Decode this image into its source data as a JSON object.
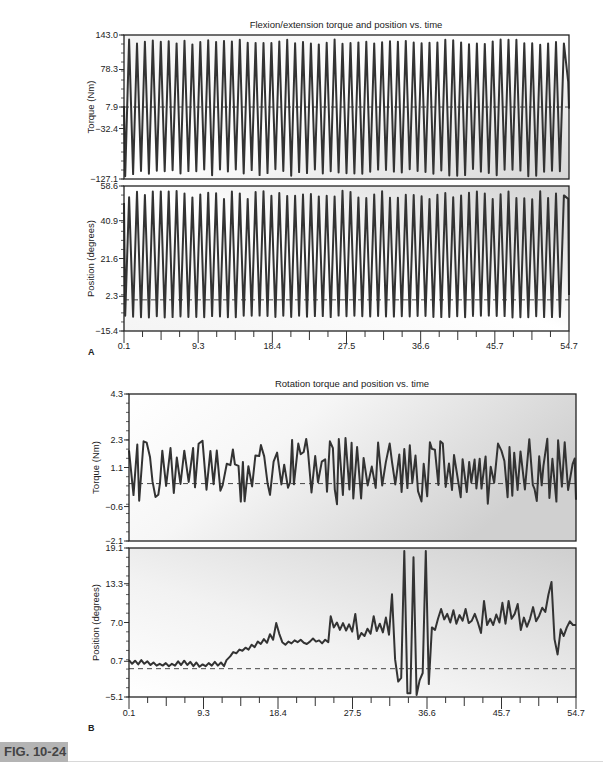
{
  "figure_label": "FIG. 10-24",
  "chart_data": [
    {
      "id": "A",
      "panel_letter": "A",
      "type": "line",
      "title": "Flexion/extension torque and position vs. time",
      "xlabel": "",
      "x_ticks": [
        "0.1",
        "9.3",
        "18.4",
        "27.5",
        "36.6",
        "45.7",
        "54.7"
      ],
      "xlim": [
        0.1,
        54.7
      ],
      "subplots": [
        {
          "name": "torque",
          "ylabel": "Torque (Nm)",
          "y_ticks": [
            "143.0",
            "78.3",
            "7.9",
            "-32.4",
            "-127.1"
          ],
          "y_tick_values": [
            143.0,
            78.3,
            7.9,
            -32.4,
            -127.1
          ],
          "ylim": [
            -127.1,
            143.0
          ],
          "reference_line": 7.9,
          "signal": {
            "kind": "oscillation",
            "cycles": 56,
            "peak": 130,
            "trough": -115,
            "start": 10,
            "end": 5,
            "end_peak": 55
          }
        },
        {
          "name": "position",
          "ylabel": "Position (degrees)",
          "y_ticks": [
            "58.6",
            "40.9",
            "21.6",
            "2.3",
            "-15.4"
          ],
          "y_tick_values": [
            58.6,
            40.9,
            21.6,
            2.3,
            -15.4
          ],
          "ylim": [
            -15.4,
            58.6
          ],
          "reference_line": 0.5,
          "signal": {
            "kind": "oscillation",
            "cycles": 56,
            "peak": 54,
            "trough": -8,
            "start": 50,
            "end": 3,
            "end_peak": 52
          }
        }
      ]
    },
    {
      "id": "B",
      "panel_letter": "B",
      "type": "line",
      "title": "Rotation torque and position vs. time",
      "xlabel": "",
      "x_ticks": [
        "0.1",
        "9.3",
        "18.4",
        "27.5",
        "36.6",
        "45.7",
        "54.7"
      ],
      "xlim": [
        0.1,
        54.7
      ],
      "subplots": [
        {
          "name": "torque",
          "ylabel": "Torque (Nm)",
          "y_ticks": [
            "4.3",
            "2.3",
            "1.1",
            "-0.6",
            "-2.1"
          ],
          "y_tick_values": [
            4.3,
            2.3,
            1.1,
            -0.6,
            -2.1
          ],
          "ylim": [
            -2.1,
            4.3
          ],
          "reference_line": 0.4,
          "signal": {
            "kind": "noisy",
            "high": 2.4,
            "low": -0.5
          }
        },
        {
          "name": "position",
          "ylabel": "Position (degrees)",
          "y_ticks": [
            "19.1",
            "13.3",
            "7.0",
            "0.7",
            "-5.1"
          ],
          "y_tick_values": [
            19.1,
            13.3,
            7.0,
            0.7,
            -5.1
          ],
          "ylim": [
            -5.1,
            19.1
          ],
          "reference_line": -0.5,
          "points": [
            [
              0.1,
              0.9
            ],
            [
              0.6,
              0.3
            ],
            [
              1.1,
              0.8
            ],
            [
              1.6,
              0.2
            ],
            [
              2.1,
              0.9
            ],
            [
              2.6,
              0.3
            ],
            [
              3.1,
              0.7
            ],
            [
              3.6,
              0.1
            ],
            [
              4.1,
              0.5
            ],
            [
              4.6,
              0.0
            ],
            [
              5.1,
              0.3
            ],
            [
              5.6,
              0.0
            ],
            [
              6.1,
              0.4
            ],
            [
              6.6,
              -0.1
            ],
            [
              7.1,
              0.3
            ],
            [
              7.6,
              0.0
            ],
            [
              8.1,
              0.7
            ],
            [
              8.6,
              0.1
            ],
            [
              9.1,
              0.8
            ],
            [
              9.6,
              0.1
            ],
            [
              10.1,
              0.6
            ],
            [
              10.6,
              -0.1
            ],
            [
              11.1,
              0.5
            ],
            [
              11.6,
              -0.2
            ],
            [
              12.1,
              0.2
            ],
            [
              12.6,
              -0.1
            ],
            [
              13.1,
              0.4
            ],
            [
              13.6,
              0.0
            ],
            [
              14.1,
              0.6
            ],
            [
              14.6,
              0.0
            ],
            [
              15.1,
              0.5
            ],
            [
              15.6,
              -0.1
            ],
            [
              16.0,
              0.9
            ],
            [
              16.6,
              1.5
            ],
            [
              17.1,
              2.2
            ],
            [
              17.6,
              2.0
            ],
            [
              18.1,
              2.6
            ],
            [
              18.6,
              2.4
            ],
            [
              19.1,
              2.9
            ],
            [
              19.6,
              2.6
            ],
            [
              20.1,
              3.4
            ],
            [
              20.6,
              3.0
            ],
            [
              21.1,
              3.9
            ],
            [
              21.6,
              3.5
            ],
            [
              22.1,
              4.3
            ],
            [
              22.6,
              3.7
            ],
            [
              23.1,
              5.1
            ],
            [
              23.6,
              4.2
            ],
            [
              24.1,
              6.9
            ],
            [
              24.6,
              5.2
            ],
            [
              25.1,
              3.8
            ],
            [
              25.6,
              3.4
            ],
            [
              26.1,
              3.9
            ],
            [
              26.6,
              3.6
            ],
            [
              27.1,
              4.1
            ],
            [
              27.6,
              3.8
            ],
            [
              28.1,
              4.2
            ],
            [
              28.6,
              3.7
            ],
            [
              29.1,
              3.5
            ],
            [
              29.6,
              3.9
            ],
            [
              30.1,
              4.4
            ],
            [
              30.6,
              3.9
            ],
            [
              31.1,
              4.1
            ],
            [
              31.6,
              3.6
            ],
            [
              32.1,
              4.2
            ],
            [
              32.6,
              3.8
            ],
            [
              33.0,
              8.0
            ],
            [
              33.5,
              6.2
            ],
            [
              34.0,
              7.0
            ],
            [
              34.5,
              5.8
            ],
            [
              35.0,
              6.9
            ],
            [
              35.5,
              5.7
            ],
            [
              36.0,
              6.7
            ],
            [
              36.5,
              5.5
            ],
            [
              37.0,
              8.4
            ],
            [
              37.5,
              4.3
            ],
            [
              38.0,
              5.3
            ],
            [
              38.5,
              4.8
            ],
            [
              39.0,
              6.0
            ],
            [
              39.5,
              5.2
            ],
            [
              40.0,
              8.0
            ],
            [
              40.5,
              5.6
            ],
            [
              41.0,
              6.8
            ],
            [
              41.5,
              5.4
            ],
            [
              42.0,
              7.8
            ],
            [
              42.5,
              5.0
            ],
            [
              43.0,
              11.6
            ],
            [
              43.5,
              1.0
            ],
            [
              44.0,
              -2.6
            ],
            [
              44.5,
              -2.0
            ],
            [
              45.0,
              18.6
            ],
            [
              45.5,
              -4.5
            ],
            [
              46.0,
              -4.5
            ],
            [
              46.5,
              17.6
            ],
            [
              47.0,
              -4.9
            ],
            [
              47.5,
              -2.4
            ],
            [
              48.0,
              -1.2
            ],
            [
              48.5,
              18.6
            ],
            [
              49.0,
              -3.0
            ],
            [
              49.5,
              6.2
            ],
            [
              50.0,
              5.8
            ]
          ],
          "x_scale_note": "raw points span 0.1-84; mapped to xlim",
          "tail_points": [
            [
              50.5,
              7.6
            ],
            [
              51.0,
              9.2
            ],
            [
              51.5,
              7.5
            ],
            [
              52.0,
              8.4
            ],
            [
              52.5,
              7.0
            ],
            [
              53.0,
              9.0
            ],
            [
              53.5,
              6.8
            ],
            [
              54.0,
              8.2
            ],
            [
              54.5,
              7.3
            ],
            [
              55.0,
              9.2
            ],
            [
              55.5,
              6.9
            ],
            [
              56.0,
              7.3
            ],
            [
              56.5,
              8.4
            ],
            [
              57.0,
              7.0
            ],
            [
              57.5,
              5.3
            ],
            [
              58.0,
              10.5
            ],
            [
              58.5,
              6.6
            ],
            [
              59.0,
              7.6
            ],
            [
              59.5,
              6.6
            ],
            [
              60.0,
              8.3
            ],
            [
              60.5,
              7.0
            ],
            [
              61.0,
              10.2
            ],
            [
              61.5,
              6.8
            ],
            [
              62.0,
              10.5
            ],
            [
              62.5,
              7.6
            ],
            [
              63.0,
              8.4
            ],
            [
              63.5,
              10.0
            ],
            [
              64.0,
              5.8
            ],
            [
              64.5,
              7.8
            ],
            [
              65.0,
              6.3
            ],
            [
              65.5,
              7.6
            ],
            [
              66.0,
              9.5
            ],
            [
              66.5,
              7.2
            ],
            [
              67.0,
              8.1
            ],
            [
              67.5,
              9.4
            ],
            [
              68.0,
              8.7
            ],
            [
              68.5,
              11.5
            ],
            [
              69.0,
              13.6
            ],
            [
              69.5,
              4.3
            ],
            [
              70.0,
              1.8
            ],
            [
              70.5,
              5.9
            ],
            [
              71.0,
              4.8
            ],
            [
              71.5,
              6.2
            ],
            [
              72.0,
              7.2
            ],
            [
              72.5,
              6.6
            ],
            [
              73.0,
              6.6
            ]
          ]
        }
      ]
    }
  ]
}
